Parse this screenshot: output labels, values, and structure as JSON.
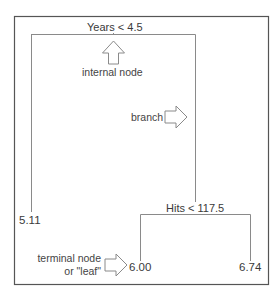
{
  "diagram": {
    "type": "regression-tree",
    "colors": {
      "frame": "#555555",
      "tree_line": "#888888",
      "arrow": "#888888",
      "text": "#3a3a3a",
      "background": "#ffffff"
    },
    "nodes": {
      "root": {
        "split_label": "Years < 4.5",
        "variable": "Years",
        "operator": "<",
        "threshold": "4.5"
      },
      "right_internal": {
        "split_label": "Hits < 117.5",
        "variable": "Hits",
        "operator": "<",
        "threshold": "117.5"
      },
      "leaves": [
        {
          "id": "leaf-left",
          "value": "5.11"
        },
        {
          "id": "leaf-middle",
          "value": "6.00"
        },
        {
          "id": "leaf-right",
          "value": "6.74"
        }
      ]
    },
    "annotations": {
      "internal_node": "internal node",
      "branch": "branch",
      "terminal_line1": "terminal node",
      "terminal_line2": "or \"leaf\""
    }
  }
}
